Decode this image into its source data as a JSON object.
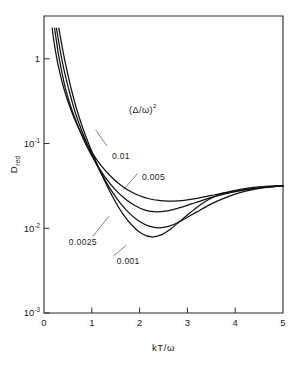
{
  "figure": {
    "background_color": "#ffffff",
    "line_color": "#111111",
    "axis_color": "#2b2b2b"
  },
  "chart_data": {
    "type": "line",
    "title": "",
    "xlabel": "kT/ω",
    "ylabel": "D",
    "ylabel_subscript": "red",
    "xlim": [
      0,
      5
    ],
    "ylim": [
      0.001,
      3.2
    ],
    "yscale": "log",
    "xscale": "linear",
    "grid": false,
    "frame": "box",
    "xticks": [
      0,
      1,
      2,
      3,
      4,
      5
    ],
    "xticklabels": [
      "0",
      "1",
      "2",
      "3",
      "4",
      "5"
    ],
    "yticks": [
      1,
      0.1,
      0.01,
      0.001
    ],
    "yticklabels": [
      "1",
      "10",
      "10",
      "10"
    ],
    "ytick_exponents": [
      "",
      "-1",
      "-2",
      "-3"
    ],
    "legend_title": "(Δ/ω)",
    "legend_title_exponent": "2",
    "legend_position": "inside-upper-center",
    "series": [
      {
        "name": "0.01",
        "label": "0.01",
        "label_x": 1.42,
        "label_y": 0.071,
        "leader_from_x": 1.32,
        "leader_from_y": 0.093,
        "leader_to_x": 1.08,
        "leader_to_y": 0.145,
        "x": [
          0.17,
          0.2,
          0.25,
          0.3,
          0.4,
          0.5,
          0.65,
          0.8,
          1.0,
          1.2,
          1.4,
          1.6,
          1.8,
          2.0,
          2.2,
          2.4,
          2.6,
          2.8,
          3.0,
          3.2,
          3.5,
          3.8,
          4.1,
          4.4,
          4.7,
          5.0
        ],
        "y": [
          2.3,
          1.72,
          1.15,
          0.82,
          0.48,
          0.315,
          0.188,
          0.125,
          0.0785,
          0.0545,
          0.0408,
          0.0325,
          0.0274,
          0.0242,
          0.0223,
          0.0213,
          0.0209,
          0.0211,
          0.0217,
          0.0226,
          0.0244,
          0.0263,
          0.0281,
          0.0296,
          0.0307,
          0.0315
        ]
      },
      {
        "name": "0.005",
        "label": "0.005",
        "label_x": 2.05,
        "label_y": 0.0405,
        "leader_from_x": 1.96,
        "leader_from_y": 0.0445,
        "leader_to_x": 1.66,
        "leader_to_y": 0.0285,
        "x": [
          0.22,
          0.26,
          0.3,
          0.36,
          0.45,
          0.58,
          0.72,
          0.9,
          1.1,
          1.3,
          1.5,
          1.7,
          1.9,
          2.1,
          2.3,
          2.5,
          2.7,
          2.9,
          3.1,
          3.3,
          3.6,
          3.9,
          4.2,
          4.5,
          4.8,
          5.0
        ],
        "y": [
          2.3,
          1.62,
          1.14,
          0.76,
          0.445,
          0.252,
          0.156,
          0.0915,
          0.0572,
          0.0385,
          0.0282,
          0.0222,
          0.0186,
          0.0165,
          0.0157,
          0.0158,
          0.0166,
          0.0179,
          0.0195,
          0.0212,
          0.0239,
          0.0263,
          0.0284,
          0.0299,
          0.031,
          0.0316
        ]
      },
      {
        "name": "0.0025",
        "label": "0.0025",
        "label_x": 0.52,
        "label_y": 0.0069,
        "leader_from_x": 1.02,
        "leader_from_y": 0.008,
        "leader_to_x": 1.36,
        "leader_to_y": 0.0139,
        "x": [
          0.26,
          0.3,
          0.35,
          0.42,
          0.52,
          0.65,
          0.8,
          1.0,
          1.2,
          1.4,
          1.6,
          1.8,
          2.0,
          2.2,
          2.4,
          2.6,
          2.8,
          3.0,
          3.2,
          3.5,
          3.8,
          4.1,
          4.4,
          4.7,
          5.0
        ],
        "y": [
          2.3,
          1.68,
          1.15,
          0.735,
          0.432,
          0.236,
          0.137,
          0.0742,
          0.0442,
          0.0284,
          0.0197,
          0.0148,
          0.012,
          0.0106,
          0.0101,
          0.0105,
          0.0117,
          0.0135,
          0.0156,
          0.0194,
          0.023,
          0.0263,
          0.0288,
          0.0305,
          0.0316
        ]
      },
      {
        "name": "0.001",
        "label": "0.001",
        "label_x": 1.52,
        "label_y": 0.0041,
        "leader_from_x": 1.45,
        "leader_from_y": 0.0047,
        "leader_to_x": 1.72,
        "leader_to_y": 0.0063,
        "x": [
          0.31,
          0.35,
          0.4,
          0.47,
          0.57,
          0.7,
          0.85,
          1.05,
          1.25,
          1.45,
          1.65,
          1.85,
          2.05,
          2.25,
          2.45,
          2.65,
          2.85,
          3.05,
          3.3,
          3.6,
          3.9,
          4.2,
          4.5,
          4.8,
          5.0
        ],
        "y": [
          2.3,
          1.72,
          1.2,
          0.775,
          0.44,
          0.237,
          0.132,
          0.0688,
          0.0382,
          0.0228,
          0.0148,
          0.0107,
          0.00861,
          0.00789,
          0.00835,
          0.00982,
          0.0122,
          0.0151,
          0.0195,
          0.024,
          0.0272,
          0.0294,
          0.0308,
          0.0316,
          0.0318
        ]
      }
    ]
  }
}
